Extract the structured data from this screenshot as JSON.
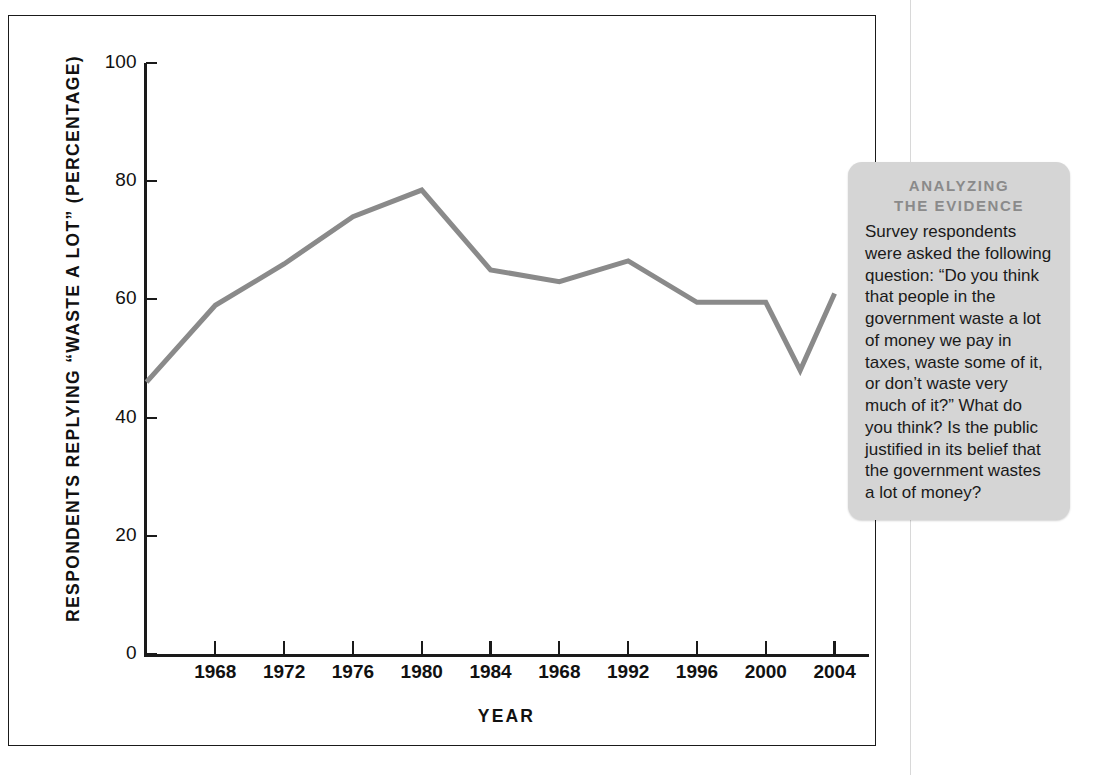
{
  "figure": {
    "y_axis_title": "RESPONDENTS REPLYING “WASTE A LOT” (PERCENTAGE)",
    "x_axis_title": "YEAR"
  },
  "evidence": {
    "heading_line1": "ANALYZING",
    "heading_line2": "THE EVIDENCE",
    "body": "Survey respondents were asked the following question: “Do you think that people in the government waste a lot of money we pay in taxes, waste some of it, or don’t waste very much of it?” What do you think? Is the public justified in its belief that the government wastes a lot of money?"
  },
  "chart_data": {
    "type": "line",
    "title": "",
    "xlabel": "YEAR",
    "ylabel": "RESPONDENTS REPLYING “WASTE A LOT” (PERCENTAGE)",
    "xlim": [
      1964,
      2006
    ],
    "ylim": [
      0,
      100
    ],
    "grid": false,
    "legend": null,
    "line_color": "#8a8a8a",
    "line_width": 5,
    "y_ticks": [
      0,
      20,
      40,
      60,
      80,
      100
    ],
    "y_tick_labels": [
      "0",
      "20",
      "40",
      "60",
      "80",
      "100"
    ],
    "x_ticks": [
      1968,
      1972,
      1976,
      1980,
      1984,
      1988,
      1992,
      1996,
      2000,
      2004
    ],
    "x_tick_labels": [
      "1968",
      "1972",
      "1976",
      "1980",
      "1984",
      "1968",
      "1992",
      "1996",
      "2000",
      "2004"
    ],
    "x": [
      1964,
      1968,
      1972,
      1976,
      1980,
      1984,
      1988,
      1992,
      1996,
      2000,
      2002,
      2004
    ],
    "values": [
      46,
      59,
      66,
      74,
      78.5,
      65,
      63,
      66.5,
      59.5,
      59.5,
      48,
      61
    ]
  }
}
